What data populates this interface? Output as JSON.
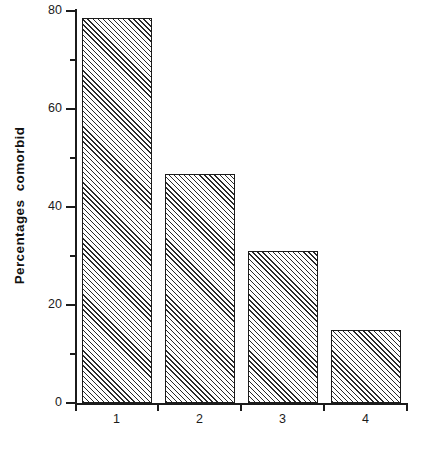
{
  "chart_data": {
    "type": "bar",
    "title": "",
    "subtitle": "",
    "xlabel": "",
    "ylabel": "Percentages  comorbid",
    "categories": [
      "1",
      "2",
      "3",
      "4"
    ],
    "values": [
      78.6,
      46.7,
      31.0,
      14.8
    ],
    "ylim": [
      0,
      80
    ],
    "xlim": [
      0,
      4
    ],
    "y_major_ticks": [
      0,
      20,
      40,
      60,
      80
    ],
    "y_minor_ticks": [
      10,
      30,
      50,
      70
    ],
    "y_tick_labels": [
      "0",
      "20",
      "40",
      "60",
      "80"
    ],
    "x_tick_labels": [
      "1",
      "2",
      "3",
      "4"
    ],
    "grid": false,
    "legend": null,
    "legend_position": "none",
    "bar_fill": "diagonal-hatch",
    "bar_edge_color": "#1b1b1b",
    "background_color": "#ffffff",
    "axis_color": "#1b1b1b",
    "annotations": []
  },
  "axes": {
    "y_title": "Percentages  comorbid"
  }
}
